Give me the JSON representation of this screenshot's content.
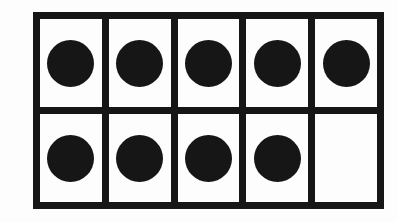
{
  "figure": {
    "rows": 2,
    "columns": 5,
    "total_cells": 10,
    "filled_count": 9,
    "empty_count": 1,
    "colors": {
      "background": "#fdfdfd",
      "frame_line": "#161616",
      "counter": "#161616"
    },
    "cells": [
      {
        "row": 1,
        "column": 1,
        "filled": true,
        "counter": "filled-circle-counter"
      },
      {
        "row": 1,
        "column": 2,
        "filled": true,
        "counter": "filled-circle-counter"
      },
      {
        "row": 1,
        "column": 3,
        "filled": true,
        "counter": "filled-circle-counter"
      },
      {
        "row": 1,
        "column": 4,
        "filled": true,
        "counter": "filled-circle-counter"
      },
      {
        "row": 1,
        "column": 5,
        "filled": true,
        "counter": "filled-circle-counter"
      },
      {
        "row": 2,
        "column": 1,
        "filled": true,
        "counter": "filled-circle-counter"
      },
      {
        "row": 2,
        "column": 2,
        "filled": true,
        "counter": "filled-circle-counter"
      },
      {
        "row": 2,
        "column": 3,
        "filled": true,
        "counter": "filled-circle-counter"
      },
      {
        "row": 2,
        "column": 4,
        "filled": true,
        "counter": "filled-circle-counter"
      },
      {
        "row": 2,
        "column": 5,
        "filled": false,
        "counter": ""
      }
    ]
  },
  "chart_data": {
    "type": "table",
    "categories": [
      "R1C1",
      "R1C2",
      "R1C3",
      "R1C4",
      "R1C5",
      "R2C1",
      "R2C2",
      "R2C3",
      "R2C4",
      "R2C5"
    ],
    "values": [
      1,
      1,
      1,
      1,
      1,
      1,
      1,
      1,
      1,
      0
    ],
    "xlabel": "",
    "ylabel": "",
    "grid": true,
    "legend": "none"
  }
}
